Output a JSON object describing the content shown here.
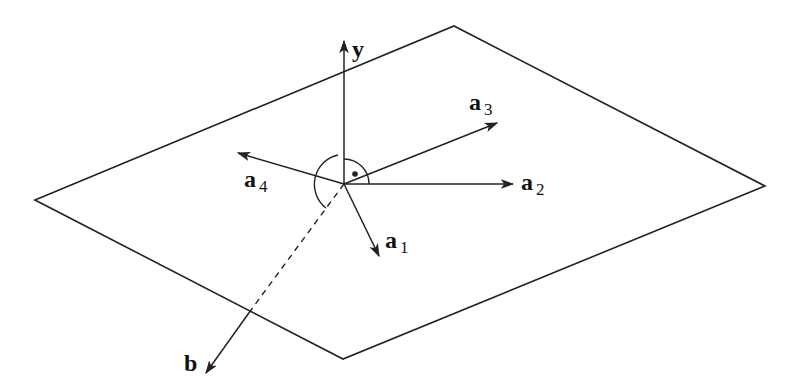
{
  "diagram": {
    "title": "",
    "colors": {
      "stroke": "#222222",
      "background": "#ffffff"
    },
    "plane": {
      "corners": [
        [
          35,
          200
        ],
        [
          454,
          26
        ],
        [
          765,
          186
        ],
        [
          343,
          359
        ]
      ]
    },
    "origin": [
      344,
      184
    ],
    "vectors": [
      {
        "id": "y",
        "name": "y",
        "subscript": "",
        "tip": [
          344,
          40
        ],
        "label_pos": [
          352,
          57
        ]
      },
      {
        "id": "a1",
        "name": "a",
        "subscript": "1",
        "tip": [
          380,
          257
        ],
        "label_pos": [
          385,
          248
        ]
      },
      {
        "id": "a2",
        "name": "a",
        "subscript": "2",
        "tip": [
          514,
          184
        ],
        "label_pos": [
          521,
          190
        ]
      },
      {
        "id": "a3",
        "name": "a",
        "subscript": "3",
        "tip": [
          498,
          122
        ],
        "label_pos": [
          469,
          110
        ]
      },
      {
        "id": "a4",
        "name": "a",
        "subscript": "4",
        "tip": [
          237,
          153
        ],
        "label_pos": [
          244,
          187
        ]
      },
      {
        "id": "b",
        "name": "b",
        "subscript": "",
        "tip": [
          205,
          374
        ],
        "label_pos": [
          184,
          371
        ]
      }
    ],
    "b_dashed_until": [
      251,
      310
    ],
    "annotations": {
      "right_angle_marker": "quarter arc with dot between y and a2",
      "angle_arc": "arc between y and b on left side"
    },
    "labels": {
      "y": "y",
      "a1": "a",
      "a1_sub": "1",
      "a2": "a",
      "a2_sub": "2",
      "a3": "a",
      "a3_sub": "3",
      "a4": "a",
      "a4_sub": "4",
      "b": "b"
    }
  }
}
